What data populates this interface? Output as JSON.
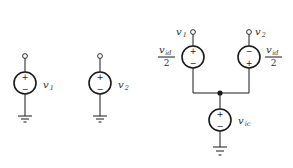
{
  "diagram": {
    "stroke_color": "#1a1a1a",
    "background": "#ffffff",
    "single_sources": [
      {
        "id": "v1-source",
        "symbol": "v",
        "subscript": "1",
        "top_sign": "+",
        "bottom_sign": "−",
        "grounded": true
      },
      {
        "id": "v2-source",
        "symbol": "v",
        "subscript": "2",
        "top_sign": "+",
        "bottom_sign": "−",
        "grounded": true
      }
    ],
    "equivalent_circuit": {
      "terminals": [
        {
          "symbol": "v",
          "subscript": "1"
        },
        {
          "symbol": "v",
          "subscript": "2"
        }
      ],
      "differential_sources": [
        {
          "id": "vid-left",
          "numerator_symbol": "v",
          "numerator_subscript": "id",
          "denominator": "2",
          "top_sign": "+",
          "bottom_sign": "−"
        },
        {
          "id": "vid-right",
          "numerator_symbol": "v",
          "numerator_subscript": "id",
          "denominator": "2",
          "top_sign": "−",
          "bottom_sign": "+"
        }
      ],
      "common_source": {
        "id": "vic",
        "symbol": "v",
        "subscript": "ic",
        "top_sign": "+",
        "bottom_sign": "−",
        "grounded": true
      },
      "junction": "dot"
    }
  }
}
